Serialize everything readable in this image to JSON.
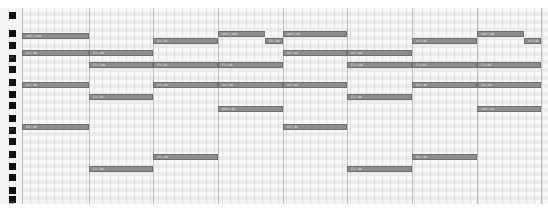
{
  "piano_roll": {
    "octave_labels": [
      {
        "label": "C4",
        "y": 47
      },
      {
        "label": "C3",
        "y": 119
      },
      {
        "label": "C2",
        "y": 192
      }
    ],
    "black_keys_y": [
      4,
      22,
      34,
      47,
      58,
      71,
      83,
      94,
      107,
      119,
      130,
      143,
      155,
      166,
      179,
      188
    ],
    "beat_x": [
      0,
      67,
      131,
      196,
      261,
      325,
      390,
      455,
      519
    ],
    "colors": {
      "note_fill": "#8c8c8c",
      "note_border": "#6f6f6f",
      "beat_line": "#bdbdbd",
      "black_key": "#111111"
    },
    "notes": [
      {
        "label": "A#3 | 100",
        "x": 0,
        "w": 67,
        "y": 25
      },
      {
        "label": "A3 | 92",
        "x": 131,
        "w": 65,
        "y": 30
      },
      {
        "label": "A#3 | 100",
        "x": 196,
        "w": 47,
        "y": 23
      },
      {
        "label": "A3 | 88",
        "x": 243,
        "w": 18,
        "y": 30
      },
      {
        "label": "A#3 | 92",
        "x": 261,
        "w": 64,
        "y": 23
      },
      {
        "label": "A3 | 96",
        "x": 390,
        "w": 65,
        "y": 30
      },
      {
        "label": "A#3 | 92",
        "x": 455,
        "w": 47,
        "y": 23
      },
      {
        "label": "A3 | 92",
        "x": 502,
        "w": 17,
        "y": 30
      },
      {
        "label": "G3 | 96",
        "x": 0,
        "w": 67,
        "y": 42
      },
      {
        "label": "G3 | 88",
        "x": 67,
        "w": 64,
        "y": 42
      },
      {
        "label": "G3 | 92",
        "x": 261,
        "w": 64,
        "y": 42
      },
      {
        "label": "G3 | 88",
        "x": 325,
        "w": 65,
        "y": 42
      },
      {
        "label": "F3 | 100",
        "x": 67,
        "w": 64,
        "y": 54
      },
      {
        "label": "F3 | 92",
        "x": 131,
        "w": 65,
        "y": 54
      },
      {
        "label": "F3 | 88",
        "x": 196,
        "w": 65,
        "y": 54
      },
      {
        "label": "F3 | 100",
        "x": 325,
        "w": 65,
        "y": 54
      },
      {
        "label": "F3 | 92",
        "x": 390,
        "w": 65,
        "y": 54
      },
      {
        "label": "F3 | 96",
        "x": 455,
        "w": 64,
        "y": 54
      },
      {
        "label": "D3 | 96",
        "x": 0,
        "w": 67,
        "y": 74
      },
      {
        "label": "D3 | 92",
        "x": 131,
        "w": 65,
        "y": 74
      },
      {
        "label": "D3 | 88",
        "x": 196,
        "w": 65,
        "y": 74
      },
      {
        "label": "D3 | 92",
        "x": 261,
        "w": 64,
        "y": 74
      },
      {
        "label": "D3 | 96",
        "x": 390,
        "w": 65,
        "y": 74
      },
      {
        "label": "D3 | 92",
        "x": 455,
        "w": 64,
        "y": 74
      },
      {
        "label": "C3 | 92",
        "x": 67,
        "w": 64,
        "y": 86
      },
      {
        "label": "C3 | 88",
        "x": 325,
        "w": 65,
        "y": 86
      },
      {
        "label": "A#2 | 92",
        "x": 196,
        "w": 65,
        "y": 98
      },
      {
        "label": "A#2 | 92",
        "x": 455,
        "w": 64,
        "y": 98
      },
      {
        "label": "G2 | 92",
        "x": 0,
        "w": 67,
        "y": 116
      },
      {
        "label": "G2 | 92",
        "x": 261,
        "w": 64,
        "y": 116
      },
      {
        "label": "D2 | 88",
        "x": 131,
        "w": 65,
        "y": 146
      },
      {
        "label": "D2 | 88",
        "x": 390,
        "w": 65,
        "y": 146
      },
      {
        "label": "C2 | 88",
        "x": 67,
        "w": 64,
        "y": 158
      },
      {
        "label": "C2 | 88",
        "x": 325,
        "w": 65,
        "y": 158
      }
    ]
  }
}
